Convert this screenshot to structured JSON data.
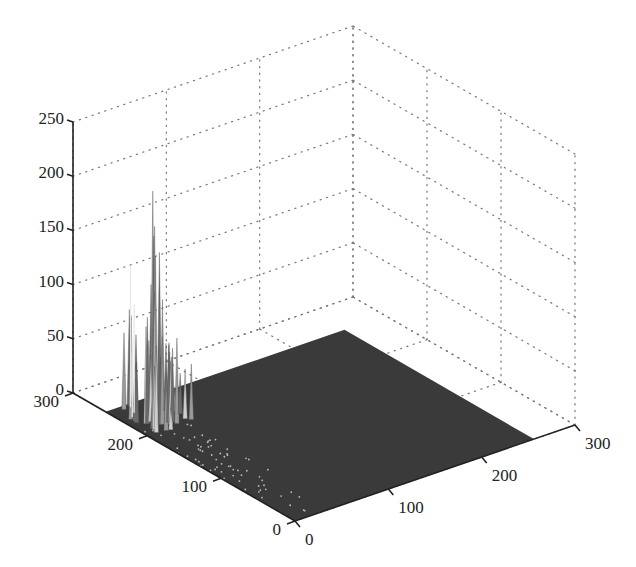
{
  "chart_data": {
    "type": "surface3d",
    "title": "",
    "xlabel": "",
    "ylabel": "",
    "zlabel": "",
    "x_ticks": [
      "0",
      "100",
      "200",
      "300"
    ],
    "y_ticks": [
      "0",
      "100",
      "200",
      "300"
    ],
    "z_ticks": [
      "0",
      "50",
      "100",
      "150",
      "200",
      "250"
    ],
    "xlim": [
      0,
      300
    ],
    "ylim": [
      0,
      300
    ],
    "zlim": [
      0,
      250
    ],
    "grid": true,
    "grid_style": "dotted",
    "surface_extent": {
      "x": [
        0,
        256
      ],
      "y": [
        0,
        256
      ]
    },
    "surface_color": "#3a3a3a",
    "peaks": [
      {
        "x": 30,
        "y": 230,
        "z": 205
      },
      {
        "x": 28,
        "y": 225,
        "z": 175
      },
      {
        "x": 35,
        "y": 235,
        "z": 160
      },
      {
        "x": 25,
        "y": 220,
        "z": 150
      },
      {
        "x": 45,
        "y": 240,
        "z": 140
      },
      {
        "x": 20,
        "y": 215,
        "z": 120
      },
      {
        "x": 40,
        "y": 245,
        "z": 110
      },
      {
        "x": 15,
        "y": 210,
        "z": 90
      },
      {
        "x": 10,
        "y": 200,
        "z": 80
      }
    ]
  }
}
